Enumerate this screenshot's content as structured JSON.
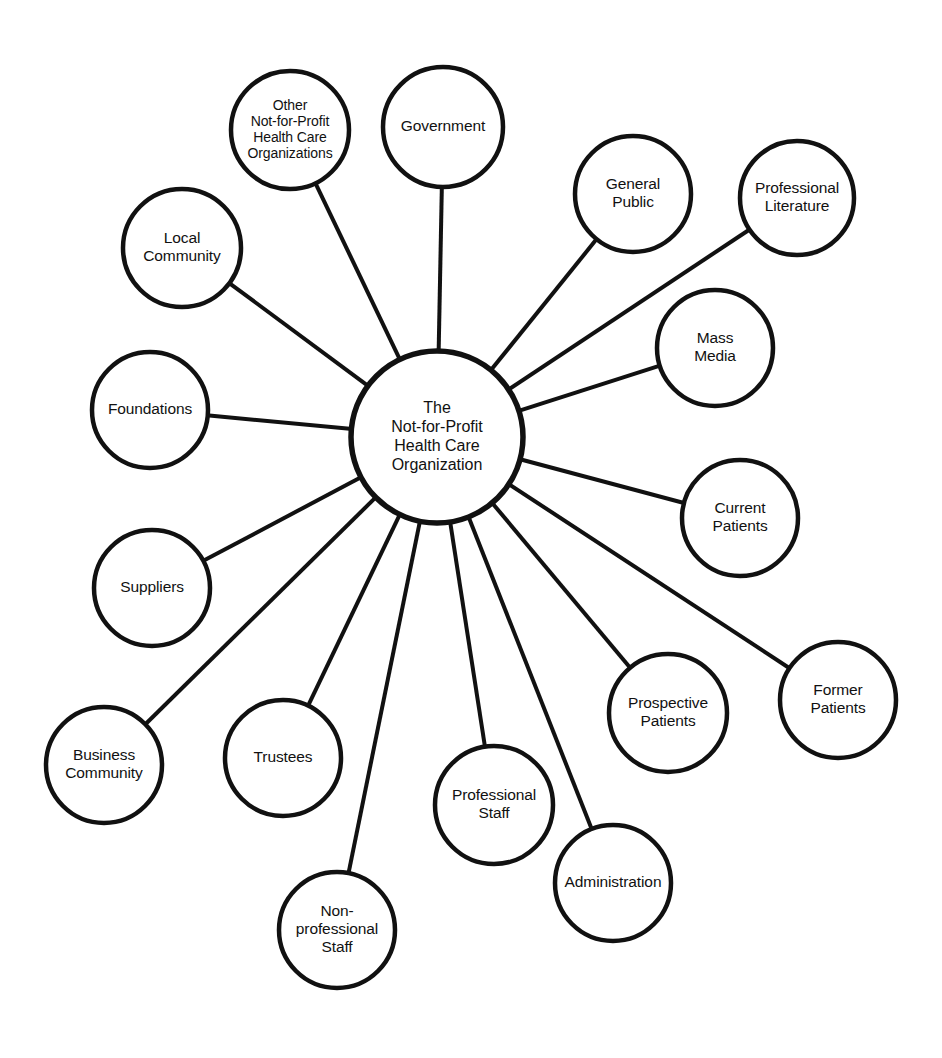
{
  "diagram": {
    "type": "radial-hub-and-spoke",
    "canvas": {
      "width": 942,
      "height": 1058,
      "background": "#ffffff"
    },
    "stroke_color": "#111111",
    "fill_color": "#ffffff",
    "center": {
      "id": "center",
      "label_lines": [
        "The",
        "Not-for-Profit",
        "Health Care",
        "Organization"
      ],
      "cx": 437,
      "cy": 437,
      "r": 86
    },
    "nodes": [
      {
        "id": "other-nfp-health-care-organizations",
        "label_lines": [
          "Other",
          "Not-for-Profit",
          "Health Care",
          "Organizations"
        ],
        "cx": 290,
        "cy": 130,
        "r": 59,
        "small": true
      },
      {
        "id": "government",
        "label_lines": [
          "Government"
        ],
        "cx": 443,
        "cy": 127,
        "r": 60,
        "small": false
      },
      {
        "id": "general-public",
        "label_lines": [
          "General",
          "Public"
        ],
        "cx": 633,
        "cy": 194,
        "r": 58,
        "small": false
      },
      {
        "id": "professional-literature",
        "label_lines": [
          "Professional",
          "Literature"
        ],
        "cx": 797,
        "cy": 198,
        "r": 57,
        "small": false
      },
      {
        "id": "mass-media",
        "label_lines": [
          "Mass",
          "Media"
        ],
        "cx": 715,
        "cy": 348,
        "r": 58,
        "small": false
      },
      {
        "id": "current-patients",
        "label_lines": [
          "Current",
          "Patients"
        ],
        "cx": 740,
        "cy": 518,
        "r": 58,
        "small": false
      },
      {
        "id": "former-patients",
        "label_lines": [
          "Former",
          "Patients"
        ],
        "cx": 838,
        "cy": 700,
        "r": 58,
        "small": false
      },
      {
        "id": "prospective-patients",
        "label_lines": [
          "Prospective",
          "Patients"
        ],
        "cx": 668,
        "cy": 713,
        "r": 59,
        "small": false
      },
      {
        "id": "administration",
        "label_lines": [
          "Administration"
        ],
        "cx": 613,
        "cy": 883,
        "r": 58,
        "small": false
      },
      {
        "id": "professional-staff",
        "label_lines": [
          "Professional",
          "Staff"
        ],
        "cx": 494,
        "cy": 805,
        "r": 59,
        "small": false
      },
      {
        "id": "non-professional-staff",
        "label_lines": [
          "Non-",
          "professional",
          "Staff"
        ],
        "cx": 337,
        "cy": 930,
        "r": 58,
        "small": false
      },
      {
        "id": "trustees",
        "label_lines": [
          "Trustees"
        ],
        "cx": 283,
        "cy": 758,
        "r": 58,
        "small": false
      },
      {
        "id": "business-community",
        "label_lines": [
          "Business",
          "Community"
        ],
        "cx": 104,
        "cy": 765,
        "r": 58,
        "small": false
      },
      {
        "id": "suppliers",
        "label_lines": [
          "Suppliers"
        ],
        "cx": 152,
        "cy": 588,
        "r": 58,
        "small": false
      },
      {
        "id": "foundations",
        "label_lines": [
          "Foundations"
        ],
        "cx": 150,
        "cy": 410,
        "r": 58,
        "small": false
      },
      {
        "id": "local-community",
        "label_lines": [
          "Local",
          "Community"
        ],
        "cx": 182,
        "cy": 248,
        "r": 59,
        "small": false
      }
    ],
    "edges": [
      {
        "from": "center",
        "to": "other-nfp-health-care-organizations"
      },
      {
        "from": "center",
        "to": "government"
      },
      {
        "from": "center",
        "to": "general-public"
      },
      {
        "from": "center",
        "to": "professional-literature"
      },
      {
        "from": "center",
        "to": "mass-media"
      },
      {
        "from": "center",
        "to": "current-patients"
      },
      {
        "from": "center",
        "to": "former-patients"
      },
      {
        "from": "center",
        "to": "prospective-patients"
      },
      {
        "from": "center",
        "to": "administration"
      },
      {
        "from": "center",
        "to": "professional-staff"
      },
      {
        "from": "center",
        "to": "non-professional-staff"
      },
      {
        "from": "center",
        "to": "trustees"
      },
      {
        "from": "center",
        "to": "business-community"
      },
      {
        "from": "center",
        "to": "suppliers"
      },
      {
        "from": "center",
        "to": "foundations"
      },
      {
        "from": "center",
        "to": "local-community"
      }
    ]
  }
}
